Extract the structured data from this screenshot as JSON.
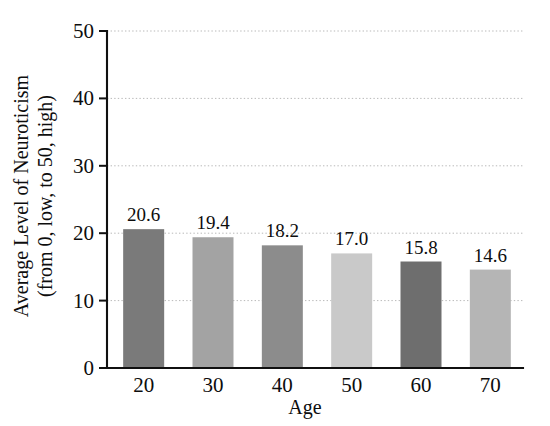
{
  "chart_data": {
    "type": "bar",
    "title": "",
    "categories": [
      "20",
      "30",
      "40",
      "50",
      "60",
      "70"
    ],
    "values": [
      20.6,
      19.4,
      18.2,
      17.0,
      15.8,
      14.6
    ],
    "value_labels": [
      "20.6",
      "19.4",
      "18.2",
      "17.0",
      "15.8",
      "14.6"
    ],
    "xlabel": "Age",
    "ylabel_line1": "Average Level of Neuroticism",
    "ylabel_line2": "(from 0, low, to 50, high)",
    "ylim": [
      0,
      50
    ],
    "yticks": [
      0,
      10,
      20,
      30,
      40,
      50
    ],
    "ytick_labels": [
      "0",
      "10",
      "20",
      "30",
      "40",
      "50"
    ],
    "grid": true,
    "grid_axis": "y",
    "legend": "none",
    "bar_colors": [
      "#7a7a7a",
      "#a3a3a3",
      "#8c8c8c",
      "#c9c9c9",
      "#6e6e6e",
      "#b5b5b5"
    ],
    "series": [
      {
        "name": "Average Level of Neuroticism",
        "values": [
          20.6,
          19.4,
          18.2,
          17.0,
          15.8,
          14.6
        ]
      }
    ]
  },
  "colors": {
    "background": "#ffffff",
    "axis": "#101010",
    "grid": "#b9b9b9",
    "text": "#0d0d0d"
  }
}
